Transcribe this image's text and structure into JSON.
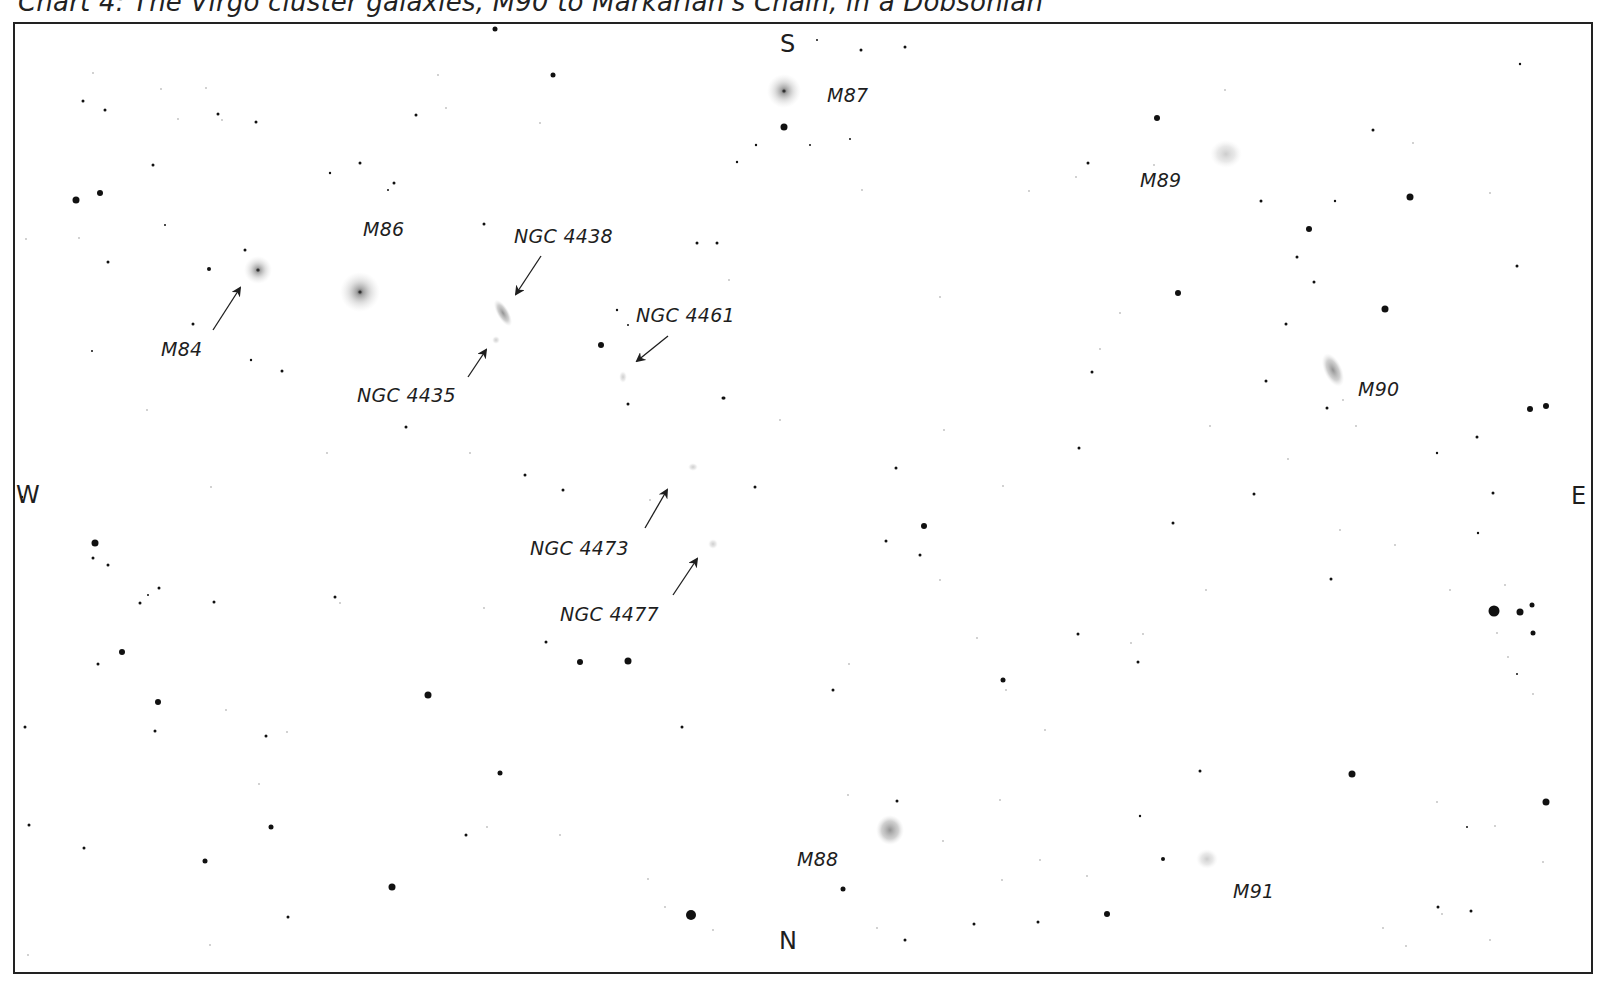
{
  "title": "Chart 4: The Virgo cluster galaxies, M90 to Markarian's Chain, in a Dobsonian",
  "compass": {
    "south": "S",
    "north": "N",
    "west": "W",
    "east": "E"
  },
  "galaxies": [
    {
      "id": "M84",
      "label": "M84",
      "x": 258,
      "y": 270,
      "rx": 14,
      "ry": 14,
      "core": true,
      "angle": 0
    },
    {
      "id": "M86",
      "label": "M86",
      "x": 360,
      "y": 292,
      "rx": 20,
      "ry": 20,
      "core": true,
      "angle": 0
    },
    {
      "id": "NGC4438",
      "label": "NGC 4438",
      "x": 503,
      "y": 313,
      "rx": 6,
      "ry": 15,
      "core": false,
      "angle": -30
    },
    {
      "id": "NGC4435",
      "label": "NGC 4435",
      "x": 496,
      "y": 340,
      "rx": 4,
      "ry": 4,
      "core": false,
      "angle": 0
    },
    {
      "id": "NGC4461",
      "label": "NGC 4461",
      "x": 623,
      "y": 377,
      "rx": 4,
      "ry": 6,
      "core": false,
      "angle": 0
    },
    {
      "id": "NGC4473",
      "label": "NGC 4473",
      "x": 693,
      "y": 467,
      "rx": 5,
      "ry": 4,
      "core": false,
      "angle": 0
    },
    {
      "id": "NGC4477",
      "label": "NGC 4477",
      "x": 713,
      "y": 544,
      "rx": 5,
      "ry": 5,
      "core": false,
      "angle": 0
    },
    {
      "id": "M87",
      "label": "M87",
      "x": 784,
      "y": 91,
      "rx": 17,
      "ry": 17,
      "core": true,
      "angle": 0
    },
    {
      "id": "M89",
      "label": "M89",
      "x": 1226,
      "y": 154,
      "rx": 16,
      "ry": 14,
      "core": false,
      "angle": 0
    },
    {
      "id": "M90",
      "label": "M90",
      "x": 1333,
      "y": 370,
      "rx": 9,
      "ry": 18,
      "core": false,
      "angle": -25
    },
    {
      "id": "M88",
      "label": "M88",
      "x": 890,
      "y": 830,
      "rx": 14,
      "ry": 15,
      "core": false,
      "angle": 0
    },
    {
      "id": "M91",
      "label": "M91",
      "x": 1207,
      "y": 859,
      "rx": 11,
      "ry": 10,
      "core": false,
      "angle": 0
    }
  ],
  "labels": [
    {
      "text": "M84",
      "x": 161,
      "y": 338
    },
    {
      "text": "M86",
      "x": 363,
      "y": 218
    },
    {
      "text": "NGC 4438",
      "x": 514,
      "y": 225
    },
    {
      "text": "NGC 4435",
      "x": 357,
      "y": 384
    },
    {
      "text": "NGC 4461",
      "x": 636,
      "y": 304
    },
    {
      "text": "NGC 4473",
      "x": 530,
      "y": 537
    },
    {
      "text": "NGC 4477",
      "x": 560,
      "y": 603
    },
    {
      "text": "M87",
      "x": 827,
      "y": 84
    },
    {
      "text": "M89",
      "x": 1140,
      "y": 169
    },
    {
      "text": "M90",
      "x": 1358,
      "y": 378
    },
    {
      "text": "M88",
      "x": 797,
      "y": 848
    },
    {
      "text": "M91",
      "x": 1233,
      "y": 880
    }
  ],
  "arrows": [
    {
      "for": "M84",
      "x1": 213,
      "y1": 330,
      "x2": 240,
      "y2": 288
    },
    {
      "for": "NGC4438",
      "x1": 541,
      "y1": 256,
      "x2": 516,
      "y2": 294
    },
    {
      "for": "NGC4435",
      "x1": 468,
      "y1": 377,
      "x2": 486,
      "y2": 350
    },
    {
      "for": "NGC4461",
      "x1": 668,
      "y1": 336,
      "x2": 637,
      "y2": 361
    },
    {
      "for": "NGC4473",
      "x1": 645,
      "y1": 528,
      "x2": 667,
      "y2": 490
    },
    {
      "for": "NGC4477",
      "x1": 673,
      "y1": 595,
      "x2": 697,
      "y2": 559
    }
  ],
  "stars": [
    [
      76,
      200,
      3.5
    ],
    [
      100,
      193,
      3
    ],
    [
      83,
      101,
      1.5
    ],
    [
      105,
      110,
      1.5
    ],
    [
      153,
      165,
      1.5
    ],
    [
      165,
      225,
      1
    ],
    [
      218,
      114,
      1.5
    ],
    [
      256,
      122,
      1.5
    ],
    [
      209,
      269,
      2
    ],
    [
      193,
      324,
      1.5
    ],
    [
      108,
      262,
      1.5
    ],
    [
      92,
      351,
      1
    ],
    [
      245,
      250,
      1.5
    ],
    [
      251,
      360,
      1.2
    ],
    [
      282,
      371,
      1.5
    ],
    [
      330,
      173,
      1.2
    ],
    [
      360,
      163,
      1.5
    ],
    [
      394,
      183,
      1.5
    ],
    [
      388,
      190,
      1
    ],
    [
      416,
      115,
      1.5
    ],
    [
      495,
      29,
      2.5
    ],
    [
      553,
      75,
      2.5
    ],
    [
      484,
      224,
      1.5
    ],
    [
      601,
      345,
      3
    ],
    [
      617,
      310,
      1.2
    ],
    [
      628,
      325,
      1
    ],
    [
      628,
      404,
      1.5
    ],
    [
      723,
      398,
      1.5
    ],
    [
      697,
      243,
      1.5
    ],
    [
      717,
      243,
      1.5
    ],
    [
      737,
      162,
      1.2
    ],
    [
      756,
      145,
      1.2
    ],
    [
      784,
      127,
      3.5
    ],
    [
      810,
      145,
      1
    ],
    [
      850,
      139,
      1
    ],
    [
      861,
      50,
      1.5
    ],
    [
      905,
      47,
      1.5
    ],
    [
      817,
      40,
      1
    ],
    [
      1157,
      118,
      3
    ],
    [
      1088,
      163,
      1.5
    ],
    [
      1410,
      197,
      3.5
    ],
    [
      1373,
      130,
      1.5
    ],
    [
      1520,
      64,
      1.2
    ],
    [
      1261,
      201,
      1.5
    ],
    [
      1335,
      201,
      1.2
    ],
    [
      1309,
      229,
      3
    ],
    [
      1297,
      257,
      1.5
    ],
    [
      1314,
      282,
      1.5
    ],
    [
      1178,
      293,
      3
    ],
    [
      1385,
      309,
      3.5
    ],
    [
      1286,
      324,
      1.5
    ],
    [
      1517,
      266,
      1.5
    ],
    [
      1266,
      381,
      1.5
    ],
    [
      1327,
      408,
      1.5
    ],
    [
      1530,
      409,
      3
    ],
    [
      1546,
      406,
      3
    ],
    [
      1477,
      437,
      1.5
    ],
    [
      1437,
      453,
      1.2
    ],
    [
      1254,
      494,
      1.5
    ],
    [
      1493,
      493,
      1.5
    ],
    [
      1478,
      533,
      1.2
    ],
    [
      1331,
      579,
      1.5
    ],
    [
      1494,
      611,
      5.5
    ],
    [
      1520,
      612,
      3.5
    ],
    [
      1532,
      605,
      2.5
    ],
    [
      1533,
      633,
      2.5
    ],
    [
      1517,
      674,
      1
    ],
    [
      1352,
      774,
      3.5
    ],
    [
      1546,
      802,
      3.5
    ],
    [
      1467,
      827,
      1
    ],
    [
      1438,
      907,
      1.5
    ],
    [
      1471,
      911,
      1.5
    ],
    [
      1079,
      448,
      1.5
    ],
    [
      1173,
      523,
      1.5
    ],
    [
      896,
      468,
      1.5
    ],
    [
      924,
      526,
      3
    ],
    [
      886,
      541,
      1.5
    ],
    [
      920,
      555,
      1.5
    ],
    [
      1078,
      634,
      1.5
    ],
    [
      1138,
      662,
      1.5
    ],
    [
      1003,
      680,
      2.5
    ],
    [
      833,
      690,
      1.5
    ],
    [
      1092,
      372,
      1.5
    ],
    [
      1200,
      771,
      1.5
    ],
    [
      1140,
      816,
      1.2
    ],
    [
      1163,
      859,
      2
    ],
    [
      1107,
      914,
      3
    ],
    [
      1038,
      922,
      1.5
    ],
    [
      974,
      924,
      1.5
    ],
    [
      905,
      940,
      1.5
    ],
    [
      843,
      889,
      2.5
    ],
    [
      897,
      801,
      1.5
    ],
    [
      691,
      915,
      5
    ],
    [
      755,
      487,
      1.5
    ],
    [
      724,
      398,
      1.5
    ],
    [
      525,
      475,
      1.5
    ],
    [
      563,
      490,
      1.5
    ],
    [
      546,
      642,
      1.5
    ],
    [
      580,
      662,
      3
    ],
    [
      628,
      661,
      3.5
    ],
    [
      682,
      727,
      1.5
    ],
    [
      500,
      773,
      2.5
    ],
    [
      466,
      835,
      1.5
    ],
    [
      428,
      695,
      3.5
    ],
    [
      392,
      887,
      3.5
    ],
    [
      288,
      917,
      1.5
    ],
    [
      205,
      861,
      2.5
    ],
    [
      271,
      827,
      2.5
    ],
    [
      158,
      702,
      3
    ],
    [
      155,
      731,
      1.5
    ],
    [
      122,
      652,
      3
    ],
    [
      98,
      664,
      1.5
    ],
    [
      95,
      543,
      3.5
    ],
    [
      93,
      558,
      1.5
    ],
    [
      108,
      565,
      1.5
    ],
    [
      140,
      603,
      1.5
    ],
    [
      148,
      595,
      1
    ],
    [
      159,
      588,
      1.5
    ],
    [
      214,
      602,
      1.5
    ],
    [
      335,
      597,
      1.5
    ],
    [
      406,
      427,
      1.5
    ],
    [
      266,
      736,
      1.5
    ],
    [
      25,
      727,
      1.5
    ],
    [
      29,
      825,
      1.5
    ],
    [
      84,
      848,
      1.5
    ],
    [
      22,
      497,
      1.2
    ]
  ],
  "faint_stars": [
    [
      93,
      73
    ],
    [
      161,
      89
    ],
    [
      206,
      88
    ],
    [
      178,
      119
    ],
    [
      222,
      120
    ],
    [
      79,
      238
    ],
    [
      26,
      239
    ],
    [
      147,
      410
    ],
    [
      211,
      487
    ],
    [
      327,
      453
    ],
    [
      470,
      453
    ],
    [
      340,
      603
    ],
    [
      226,
      710
    ],
    [
      287,
      732
    ],
    [
      259,
      784
    ],
    [
      487,
      827
    ],
    [
      560,
      835
    ],
    [
      648,
      879
    ],
    [
      665,
      907
    ],
    [
      210,
      945
    ],
    [
      28,
      955
    ],
    [
      540,
      123
    ],
    [
      446,
      108
    ],
    [
      438,
      75
    ],
    [
      729,
      280
    ],
    [
      650,
      500
    ],
    [
      484,
      608
    ],
    [
      780,
      420
    ],
    [
      944,
      430
    ],
    [
      940,
      297
    ],
    [
      862,
      190
    ],
    [
      1029,
      191
    ],
    [
      1076,
      177
    ],
    [
      1154,
      165
    ],
    [
      1225,
      90
    ],
    [
      1413,
      143
    ],
    [
      1490,
      193
    ],
    [
      1343,
      400
    ],
    [
      1356,
      426
    ],
    [
      1505,
      585
    ],
    [
      1497,
      633
    ],
    [
      1508,
      657
    ],
    [
      1533,
      694
    ],
    [
      1437,
      802
    ],
    [
      1543,
      862
    ],
    [
      1495,
      826
    ],
    [
      1490,
      940
    ],
    [
      1406,
      946
    ],
    [
      1383,
      928
    ],
    [
      1442,
      914
    ],
    [
      1210,
      426
    ],
    [
      1206,
      590
    ],
    [
      1131,
      643
    ],
    [
      849,
      664
    ],
    [
      977,
      638
    ],
    [
      1143,
      634
    ],
    [
      1006,
      690
    ],
    [
      1045,
      730
    ],
    [
      1087,
      876
    ],
    [
      1040,
      860
    ],
    [
      1002,
      880
    ],
    [
      848,
      795
    ],
    [
      817,
      863
    ],
    [
      943,
      841
    ],
    [
      877,
      928
    ],
    [
      713,
      930
    ],
    [
      1000,
      800
    ],
    [
      940,
      580
    ],
    [
      1003,
      486
    ],
    [
      1340,
      530
    ],
    [
      1450,
      590
    ],
    [
      1395,
      545
    ],
    [
      1288,
      459
    ],
    [
      1120,
      313
    ],
    [
      1100,
      349
    ]
  ]
}
